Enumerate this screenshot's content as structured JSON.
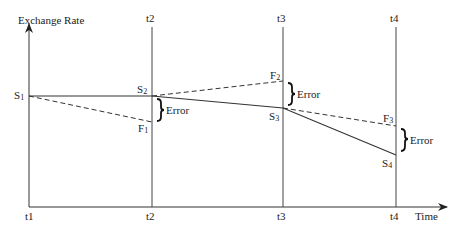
{
  "axes": {
    "y_label": "Exchange Rate",
    "x_label": "Time"
  },
  "time_labels_top": [
    "t2",
    "t3",
    "t4"
  ],
  "time_labels_bottom": [
    "t1",
    "t2",
    "t3",
    "t4"
  ],
  "spot_points": [
    {
      "label": "S",
      "sub": "1"
    },
    {
      "label": "S",
      "sub": "2"
    },
    {
      "label": "S",
      "sub": "3"
    },
    {
      "label": "S",
      "sub": "4"
    }
  ],
  "forward_points": [
    {
      "label": "F",
      "sub": "1"
    },
    {
      "label": "F",
      "sub": "2"
    },
    {
      "label": "F",
      "sub": "3"
    }
  ],
  "error_labels": [
    "Error",
    "Error",
    "Error"
  ],
  "colors": {
    "line": "#333333",
    "text": "#222222"
  }
}
